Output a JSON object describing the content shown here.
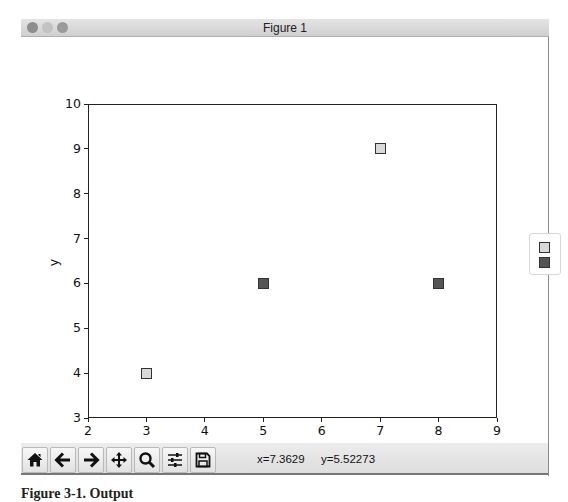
{
  "window": {
    "title": "Figure 1"
  },
  "chart_data": {
    "type": "scatter",
    "title": "",
    "xlabel": "x",
    "ylabel": "y",
    "xlim": [
      2,
      9
    ],
    "ylim": [
      3,
      10
    ],
    "grid": false,
    "x_ticks": [
      "2",
      "3",
      "4",
      "5",
      "6",
      "7",
      "8",
      "9"
    ],
    "y_ticks": [
      "3",
      "4",
      "5",
      "6",
      "7",
      "8",
      "9",
      "10"
    ],
    "marker": "square",
    "legend_position": "outside right (clipped)",
    "series": [
      {
        "name": "",
        "color": "#d9d9d9",
        "points": [
          {
            "x": 3,
            "y": 4
          },
          {
            "x": 7,
            "y": 9
          }
        ]
      },
      {
        "name": "",
        "color": "#555555",
        "points": [
          {
            "x": 5,
            "y": 6
          },
          {
            "x": 8,
            "y": 6
          }
        ]
      }
    ]
  },
  "toolbar": {
    "buttons": [
      {
        "name": "home",
        "icon": "home-icon"
      },
      {
        "name": "back",
        "icon": "arrow-left-icon"
      },
      {
        "name": "forward",
        "icon": "arrow-right-icon"
      },
      {
        "name": "pan",
        "icon": "move-icon"
      },
      {
        "name": "zoom",
        "icon": "magnifier-icon"
      },
      {
        "name": "configure-subplots",
        "icon": "sliders-icon"
      },
      {
        "name": "save",
        "icon": "floppy-disk-icon"
      }
    ],
    "coord_x": "x=7.3629",
    "coord_y": "y=5.52273"
  },
  "caption": "Figure 3-1. Output"
}
